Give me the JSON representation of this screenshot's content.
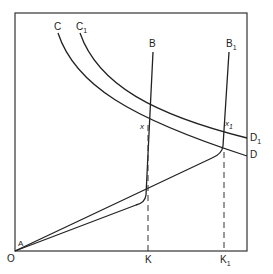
{
  "diagram": {
    "type": "economic-diagram",
    "labels": {
      "origin": "O",
      "origin_point": "A",
      "curve_c": "C",
      "curve_c1": "C",
      "curve_c1_sub": "1",
      "line_b": "B",
      "line_b1": "B",
      "line_b1_sub": "1",
      "curve_d": "D",
      "curve_d1": "D",
      "curve_d1_sub": "1",
      "point_x": "x",
      "point_x1": "x",
      "point_x1_sub": "1",
      "axis_k": "K",
      "axis_k1": "K",
      "axis_k1_sub": "1"
    },
    "colors": {
      "line": "#222222",
      "background": "#ffffff"
    }
  }
}
